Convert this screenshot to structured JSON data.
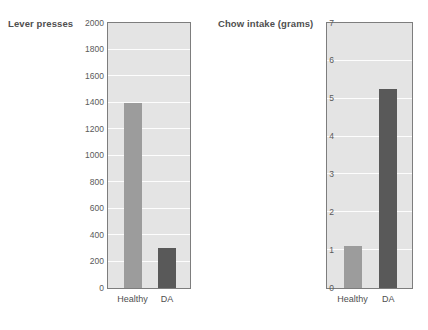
{
  "chart_data": [
    {
      "type": "bar",
      "title": "",
      "ylabel": "Lever presses",
      "xlabel": "",
      "categories": [
        "Healthy",
        "DA"
      ],
      "values": [
        1400,
        300
      ],
      "ylim": [
        0,
        2000
      ],
      "yticks": [
        2000,
        1800,
        1600,
        1400,
        1200,
        1000,
        800,
        600,
        400,
        200,
        0
      ],
      "grid": true,
      "legend": "none",
      "bar_colors": [
        "#9c9c9c",
        "#595959"
      ],
      "plot_background": "#e4e4e4",
      "gridline_color": "#fdfdfd",
      "frame_color": "#7d7d7d"
    },
    {
      "type": "bar",
      "title": "",
      "ylabel": "Chow intake (grams)",
      "xlabel": "",
      "categories": [
        "Healthy",
        "DA"
      ],
      "values": [
        1.1,
        5.25
      ],
      "ylim": [
        0,
        7
      ],
      "yticks": [
        7,
        6,
        5,
        4,
        3,
        2,
        1,
        0
      ],
      "grid": true,
      "legend": "none",
      "bar_colors": [
        "#9c9c9c",
        "#595959"
      ],
      "plot_background": "#e4e4e4",
      "gridline_color": "#fdfdfd",
      "frame_color": "#7d7d7d"
    }
  ],
  "panels": [
    {
      "axis_title": "Lever presses",
      "yticks": [
        "2000",
        "1800",
        "1600",
        "1400",
        "1200",
        "1000",
        "800",
        "600",
        "400",
        "200",
        "0"
      ],
      "xticks": [
        "Healthy",
        "DA"
      ]
    },
    {
      "axis_title": "Chow intake (grams)",
      "yticks": [
        "7",
        "6",
        "5",
        "4",
        "3",
        "2",
        "1",
        "0"
      ],
      "xticks": [
        "Healthy",
        "DA"
      ]
    }
  ]
}
